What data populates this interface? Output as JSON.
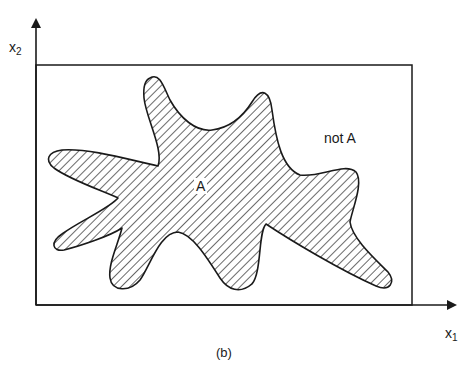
{
  "figure": {
    "caption": "(b)",
    "x_axis": {
      "label_main": "x",
      "label_sub": "1"
    },
    "y_axis": {
      "label_main": "x",
      "label_sub": "2"
    },
    "region_inside": {
      "label": "A",
      "fill": "hatched"
    },
    "region_outside": {
      "label": "not A"
    },
    "colors": {
      "stroke": "#1a1a1a",
      "background": "#ffffff",
      "hatch": "#2a2a2a"
    }
  }
}
